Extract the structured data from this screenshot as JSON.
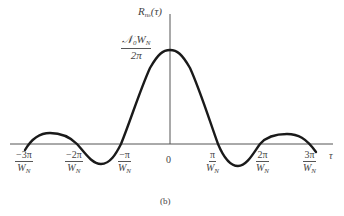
{
  "figure": {
    "ylabel": {
      "main": "R",
      "sub": "n",
      "subsub": "b",
      "arg": "(τ)"
    },
    "peak_label": {
      "numerator": "𝒩₀W",
      "numerator_sub": "N",
      "numerator_lead": "𝒩",
      "numerator_mid": "0",
      "numerator_w": "W",
      "denominator": "2π"
    },
    "xlabel": "τ",
    "caption": "(b)",
    "ticks": [
      {
        "num": "−3π",
        "den_main": "W",
        "den_sub": "N"
      },
      {
        "num": "−2π",
        "den_main": "W",
        "den_sub": "N"
      },
      {
        "num": "−π",
        "den_main": "W",
        "den_sub": "N"
      },
      {
        "num": "0"
      },
      {
        "num": "π",
        "den_main": "W",
        "den_sub": "N"
      },
      {
        "num": "2π",
        "den_main": "W",
        "den_sub": "N"
      },
      {
        "num": "3π",
        "den_main": "W",
        "den_sub": "N"
      }
    ],
    "colors": {
      "curve": "#1a1a1a",
      "axis": "#555555",
      "text": "#444444"
    }
  }
}
